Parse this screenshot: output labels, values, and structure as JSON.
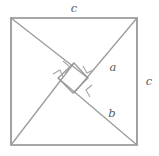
{
  "figure": {
    "name": "pythagorean-theorem-square-diagram",
    "stroke_color": "#9a9a9a",
    "outer_stroke_color": "#8b8b8b",
    "label_color": "#5a5a5a",
    "background_color": "#ffffff"
  },
  "labels": [
    {
      "id": "label-c-top",
      "text": "c",
      "x": 74,
      "y": 9,
      "name": "side-label-c-top"
    },
    {
      "id": "label-c-right",
      "text": "c",
      "x": 149,
      "y": 82,
      "name": "side-label-c-right"
    },
    {
      "id": "label-a",
      "text": "a",
      "x": 113,
      "y": 68,
      "name": "leg-label-a"
    },
    {
      "id": "label-b",
      "text": "b",
      "x": 112,
      "y": 114,
      "name": "leg-label-b"
    }
  ],
  "outer_square": {
    "name": "outer-square-side-c",
    "points": "11,18 137,18 137,145 11,145",
    "side_label": "c"
  },
  "cut_lines": [
    {
      "name": "triangle-cut-top-left",
      "x1": 11,
      "y1": 18,
      "x2": 88,
      "y2": 78
    },
    {
      "name": "triangle-cut-top-right",
      "x1": 137,
      "y1": 18,
      "x2": 74,
      "y2": 93
    },
    {
      "name": "triangle-cut-bottom-left",
      "x1": 11,
      "y1": 145,
      "x2": 74,
      "y2": 63
    },
    {
      "name": "triangle-cut-bottom-right",
      "x1": 137,
      "y1": 145,
      "x2": 58,
      "y2": 78
    }
  ],
  "inner_square": {
    "name": "inner-tilted-square",
    "points": "74,63 88,78 73,93 58,78"
  },
  "right_angle_marks": [
    {
      "name": "right-angle-mark-top",
      "points": "63,61 70,67 65,73"
    },
    {
      "name": "right-angle-mark-right",
      "points": "83,66 87,73 93,70"
    },
    {
      "name": "right-angle-mark-left",
      "points": "53,74 60,70 63,77"
    },
    {
      "name": "right-angle-mark-bottom",
      "points": "92,85 86,90 90,97"
    }
  ],
  "geometry_values": {
    "outer_side_label": "c",
    "leg_long_label": "b",
    "leg_short_label": "a",
    "triangle_count": 4,
    "inner_square_count": 1
  }
}
